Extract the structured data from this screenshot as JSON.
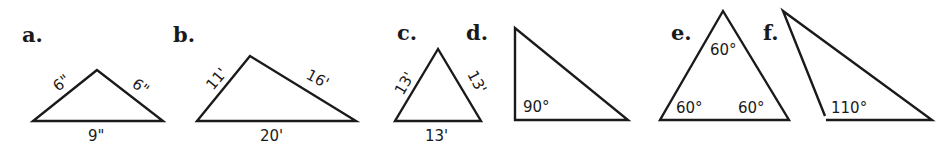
{
  "figures": [
    {
      "letter": "a.",
      "kind": "isosceles",
      "vertices": [
        [
          97,
          70
        ],
        [
          33,
          121
        ],
        [
          163,
          121
        ]
      ],
      "labels": {
        "left_side": "6\"",
        "right_side": "6\"",
        "base": "9\""
      }
    },
    {
      "letter": "b.",
      "kind": "scalene",
      "vertices": [
        [
          250,
          56
        ],
        [
          197,
          121
        ],
        [
          356,
          121
        ]
      ],
      "labels": {
        "left_side": "11'",
        "right_side": "16'",
        "base": "20'"
      }
    },
    {
      "letter": "c.",
      "kind": "equilateral",
      "vertices": [
        [
          438,
          49
        ],
        [
          395,
          121
        ],
        [
          481,
          121
        ]
      ],
      "labels": {
        "left_side": "13'",
        "right_side": "13'",
        "base": "13'"
      }
    },
    {
      "letter": "d.",
      "kind": "right",
      "vertices": [
        [
          515,
          28
        ],
        [
          515,
          120
        ],
        [
          628,
          120
        ]
      ],
      "labels": {
        "angle": "90°"
      }
    },
    {
      "letter": "e.",
      "kind": "equiangular",
      "vertices": [
        [
          723,
          11
        ],
        [
          660,
          120
        ],
        [
          789,
          120
        ]
      ],
      "labels": {
        "top_angle": "60°",
        "left_angle": "60°",
        "right_angle": "60°"
      }
    },
    {
      "letter": "f.",
      "kind": "obtuse",
      "vertices": [
        [
          783,
          11
        ],
        [
          825,
          118
        ],
        [
          932,
          120
        ]
      ],
      "labels": {
        "angle": "110°"
      }
    }
  ]
}
